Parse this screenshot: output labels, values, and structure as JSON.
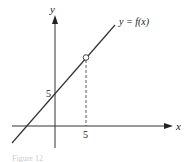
{
  "diagram": {
    "y_axis_label": "y",
    "x_axis_label": "x",
    "function_label": "y = f(x)",
    "y_intercept_label": "5",
    "x_tick_label": "5",
    "caption": "Figure 12",
    "line_color": "#333333",
    "axis_color": "#333333"
  }
}
